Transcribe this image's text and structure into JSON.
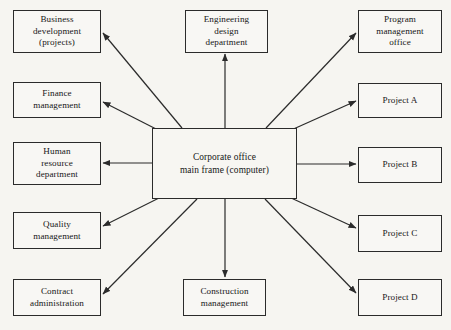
{
  "diagram": {
    "background_color": "#f6f5f1",
    "line_color": "#2b2b2b",
    "text_color": "#161616",
    "hub": {
      "id": "corporate-office-main-frame",
      "label": "Corporate office\nmain frame (computer)",
      "x": 152,
      "y": 128,
      "width": 145,
      "height": 71
    },
    "nodes": [
      {
        "id": "business-development",
        "label": "Business\ndevelopment\n(projects)",
        "x": 13,
        "y": 10,
        "width": 88,
        "height": 43,
        "column": "left"
      },
      {
        "id": "finance-management",
        "label": "Finance\nmanagement",
        "x": 13,
        "y": 82,
        "width": 88,
        "height": 36,
        "column": "left"
      },
      {
        "id": "human-resource-department",
        "label": "Human\nresource\ndepartment",
        "x": 13,
        "y": 142,
        "width": 88,
        "height": 43,
        "column": "left"
      },
      {
        "id": "quality-management",
        "label": "Quality\nmanagement",
        "x": 13,
        "y": 212,
        "width": 88,
        "height": 37,
        "column": "left"
      },
      {
        "id": "contract-administration",
        "label": "Contract\nadministration",
        "x": 13,
        "y": 279,
        "width": 88,
        "height": 37,
        "column": "left"
      },
      {
        "id": "engineering-design-department",
        "label": "Engineering\ndesign\ndepartment",
        "x": 185,
        "y": 10,
        "width": 83,
        "height": 43,
        "column": "top"
      },
      {
        "id": "construction-management",
        "label": "Construction\nmanagement",
        "x": 183,
        "y": 279,
        "width": 83,
        "height": 37,
        "column": "bottom"
      },
      {
        "id": "program-management-office",
        "label": "Program\nmanagement\noffice",
        "x": 358,
        "y": 10,
        "width": 84,
        "height": 43,
        "column": "right"
      },
      {
        "id": "project-a",
        "label": "Project A",
        "x": 358,
        "y": 83,
        "width": 84,
        "height": 35,
        "column": "right"
      },
      {
        "id": "project-b",
        "label": "Project B",
        "x": 358,
        "y": 147,
        "width": 84,
        "height": 36,
        "column": "right"
      },
      {
        "id": "project-c",
        "label": "Project C",
        "x": 358,
        "y": 215,
        "width": 84,
        "height": 37,
        "column": "right"
      },
      {
        "id": "project-d",
        "label": "Project D",
        "x": 358,
        "y": 279,
        "width": 84,
        "height": 37,
        "column": "right"
      }
    ],
    "edges": [
      {
        "id": "edge-hub-to-business-development",
        "from": "corporate-office-main-frame",
        "to": "business-development",
        "x1": 182,
        "y1": 128,
        "x2": 103,
        "y2": 33,
        "arrow": "end"
      },
      {
        "id": "edge-hub-to-finance-management",
        "from": "corporate-office-main-frame",
        "to": "finance-management",
        "x1": 160,
        "y1": 131,
        "x2": 103,
        "y2": 102,
        "arrow": "end"
      },
      {
        "id": "edge-hub-to-human-resource-department",
        "from": "corporate-office-main-frame",
        "to": "human-resource-department",
        "x1": 152,
        "y1": 163,
        "x2": 103,
        "y2": 163,
        "arrow": "end"
      },
      {
        "id": "edge-hub-to-quality-management",
        "from": "corporate-office-main-frame",
        "to": "quality-management",
        "x1": 161,
        "y1": 197,
        "x2": 103,
        "y2": 226,
        "arrow": "end"
      },
      {
        "id": "edge-hub-to-contract-administration",
        "from": "corporate-office-main-frame",
        "to": "contract-administration",
        "x1": 197,
        "y1": 199,
        "x2": 103,
        "y2": 294,
        "arrow": "end"
      },
      {
        "id": "edge-hub-to-engineering-design-department",
        "from": "corporate-office-main-frame",
        "to": "engineering-design-department",
        "x1": 225,
        "y1": 128,
        "x2": 225,
        "y2": 54,
        "arrow": "end"
      },
      {
        "id": "edge-hub-to-construction-management",
        "from": "corporate-office-main-frame",
        "to": "construction-management",
        "x1": 225,
        "y1": 199,
        "x2": 225,
        "y2": 277,
        "arrow": "end"
      },
      {
        "id": "edge-hub-to-program-management-office",
        "from": "corporate-office-main-frame",
        "to": "program-management-office",
        "x1": 266,
        "y1": 128,
        "x2": 356,
        "y2": 33,
        "arrow": "end"
      },
      {
        "id": "edge-hub-to-project-a",
        "from": "corporate-office-main-frame",
        "to": "project-a",
        "x1": 289,
        "y1": 131,
        "x2": 356,
        "y2": 101,
        "arrow": "end"
      },
      {
        "id": "edge-hub-to-project-b",
        "from": "corporate-office-main-frame",
        "to": "project-b",
        "x1": 297,
        "y1": 164,
        "x2": 356,
        "y2": 164,
        "arrow": "end"
      },
      {
        "id": "edge-hub-to-project-c",
        "from": "corporate-office-main-frame",
        "to": "project-c",
        "x1": 289,
        "y1": 197,
        "x2": 356,
        "y2": 228,
        "arrow": "end"
      },
      {
        "id": "edge-hub-to-project-d",
        "from": "corporate-office-main-frame",
        "to": "project-d",
        "x1": 265,
        "y1": 199,
        "x2": 356,
        "y2": 293,
        "arrow": "end"
      }
    ]
  }
}
